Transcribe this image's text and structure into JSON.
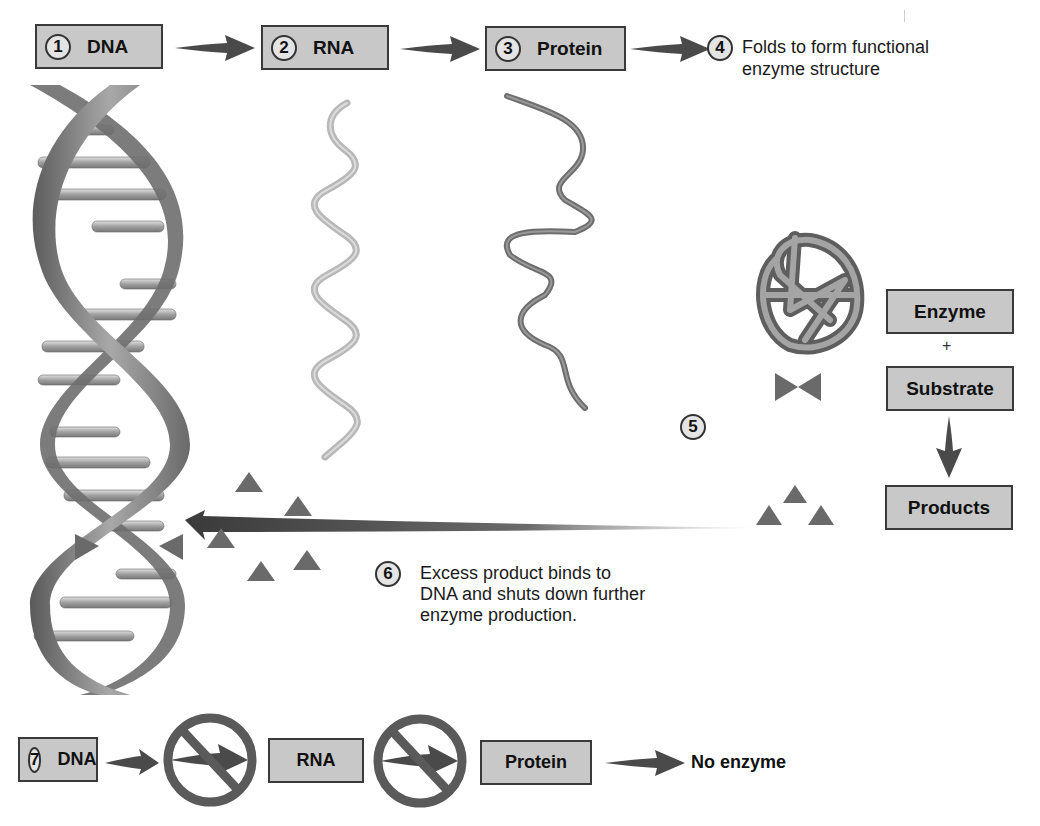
{
  "top_flow": {
    "steps": [
      {
        "number": "1",
        "label": "DNA"
      },
      {
        "number": "2",
        "label": "RNA"
      },
      {
        "number": "3",
        "label": "Protein"
      }
    ],
    "step4": {
      "number": "4",
      "text_line1": "Folds to form functional",
      "text_line2": "enzyme structure"
    }
  },
  "reaction": {
    "step_number": "5",
    "enzyme": "Enzyme",
    "plus": "+",
    "substrate": "Substrate",
    "products": "Products"
  },
  "feedback": {
    "number": "6",
    "line1": "Excess product binds to",
    "line2": "DNA and shuts down further",
    "line3": "enzyme production."
  },
  "bottom_flow": {
    "number": "7",
    "dna": "DNA",
    "rna": "RNA",
    "protein": "Protein",
    "result": "No enzyme"
  },
  "colors": {
    "box_fill": "#c8c8c8",
    "box_border": "#3a3a3a",
    "arrow": "#4a4a4a",
    "triangle": "#6a6a6a",
    "rna_strand": "#b8b8b8",
    "protein_strand": "#7a7a7a"
  }
}
